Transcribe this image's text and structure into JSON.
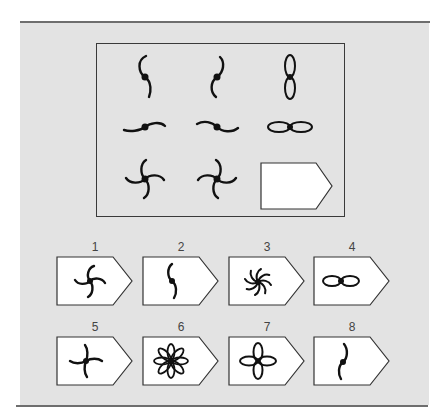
{
  "puzzle": {
    "grid": [
      {
        "row": 1,
        "col": 1,
        "figure": "two-blade-vertical-s"
      },
      {
        "row": 1,
        "col": 2,
        "figure": "two-blade-vertical-mirrored"
      },
      {
        "row": 1,
        "col": 3,
        "figure": "two-petal-vertical"
      },
      {
        "row": 2,
        "col": 1,
        "figure": "two-blade-horizontal"
      },
      {
        "row": 2,
        "col": 2,
        "figure": "two-blade-horizontal-mirrored"
      },
      {
        "row": 2,
        "col": 3,
        "figure": "two-petal-horizontal"
      },
      {
        "row": 3,
        "col": 1,
        "figure": "four-blade-pinwheel"
      },
      {
        "row": 3,
        "col": 2,
        "figure": "four-blade-pinwheel-mirrored"
      },
      {
        "row": 3,
        "col": 3,
        "figure": "blank-answer-slot"
      }
    ]
  },
  "options": [
    {
      "label": "1",
      "figure": "four-blade-pinwheel"
    },
    {
      "label": "2",
      "figure": "two-blade-vertical-s"
    },
    {
      "label": "3",
      "figure": "eight-blade-spiral"
    },
    {
      "label": "4",
      "figure": "two-petal-horizontal"
    },
    {
      "label": "5",
      "figure": "four-blade-pinwheel-alt"
    },
    {
      "label": "6",
      "figure": "eight-petal-flower"
    },
    {
      "label": "7",
      "figure": "four-petal-flower"
    },
    {
      "label": "8",
      "figure": "two-blade-vertical-mirrored"
    }
  ],
  "colors": {
    "background": "#e3e3e3",
    "stroke": "#111111",
    "frame": "#3a3a3a",
    "rule": "#6e6e6e"
  }
}
